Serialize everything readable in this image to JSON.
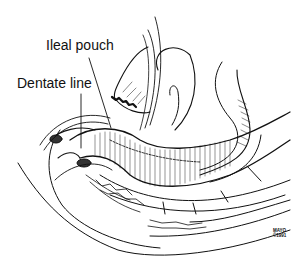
{
  "figure": {
    "type": "anatomical line illustration",
    "labels": {
      "ileal_pouch": "Ileal pouch",
      "dentate_line": "Dentate line"
    },
    "credit": {
      "line1": "MAYO",
      "line2": "©1991"
    },
    "colors": {
      "ink": "#111111",
      "background": "#ffffff"
    }
  }
}
